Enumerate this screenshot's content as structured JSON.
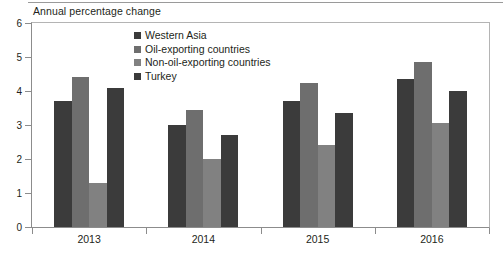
{
  "chart_data": {
    "type": "bar",
    "title": "Annual percentage change",
    "xlabel": "",
    "ylabel": "",
    "ylim": [
      0,
      6
    ],
    "yticks": [
      0,
      1,
      2,
      3,
      4,
      5,
      6
    ],
    "ytick_labels": [
      "0",
      "1",
      "2",
      "3",
      "4",
      "5",
      "6"
    ],
    "grid": false,
    "legend_position": "top-center",
    "categories": [
      "2013",
      "2014",
      "2015",
      "2016"
    ],
    "series": [
      {
        "name": "Western Asia",
        "color": "#3b3b3b",
        "values": [
          3.7,
          3.0,
          3.7,
          4.35
        ]
      },
      {
        "name": "Oil-exporting countries",
        "color": "#6e6e6e",
        "values": [
          4.4,
          3.45,
          4.25,
          4.85
        ]
      },
      {
        "name": "Non-oil-exporting countries",
        "color": "#818181",
        "values": [
          1.3,
          2.0,
          2.4,
          3.05
        ]
      },
      {
        "name": "Turkey",
        "color": "#3b3b3b",
        "values": [
          4.1,
          2.7,
          3.35,
          4.0
        ]
      }
    ]
  },
  "legend": {
    "items": [
      {
        "label": "Western Asia",
        "color": "#3b3b3b"
      },
      {
        "label": "Oil-exporting countries",
        "color": "#6e6e6e"
      },
      {
        "label": "Non-oil-exporting countries",
        "color": "#818181"
      },
      {
        "label": "Turkey",
        "color": "#3b3b3b"
      }
    ]
  }
}
